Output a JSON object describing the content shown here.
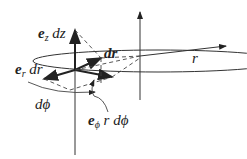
{
  "diagram": {
    "labels": {
      "ez_dz": {
        "vec": "e",
        "sub": "z",
        "rest": "dz"
      },
      "dr_vec": "dr",
      "er_dr": {
        "vec": "e",
        "sub": "r",
        "rest": "dr"
      },
      "r": "r",
      "dphi": "dϕ",
      "ephi": {
        "vec": "e",
        "sub": "ϕ",
        "rest": "r dϕ"
      }
    },
    "colors": {
      "stroke": "#222222",
      "background": "#ffffff"
    }
  }
}
